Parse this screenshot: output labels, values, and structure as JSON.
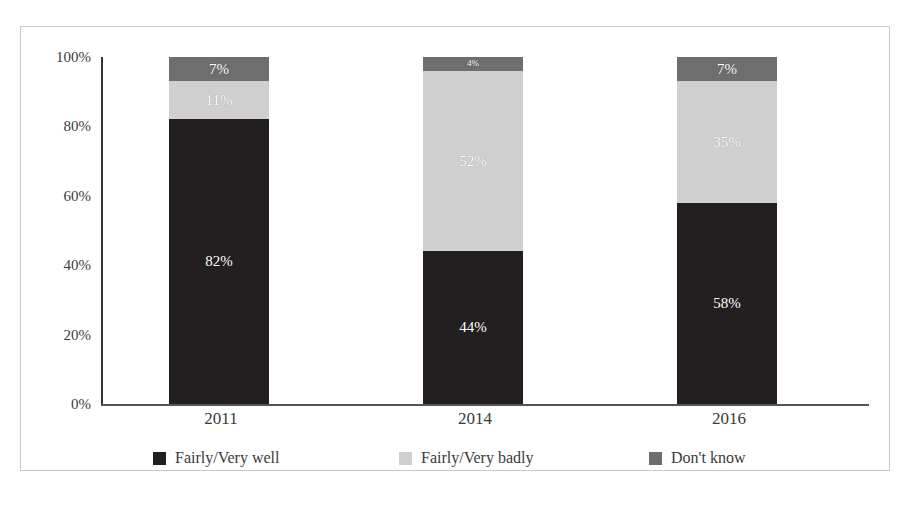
{
  "page": {
    "top_cropped_text": "",
    "caption": ""
  },
  "chart_data": {
    "type": "bar",
    "stacked": true,
    "stack_mode": "percent",
    "title": "",
    "subtitle": "",
    "xlabel": "",
    "ylabel": "",
    "categories": [
      "2011",
      "2014",
      "2016"
    ],
    "ylim": [
      0,
      100
    ],
    "yticks": [
      "0%",
      "20%",
      "40%",
      "60%",
      "80%",
      "100%"
    ],
    "ytick_values": [
      0,
      20,
      40,
      60,
      80,
      100
    ],
    "grid": false,
    "legend_position": "bottom",
    "series": [
      {
        "name": "Fairly/Very well",
        "color": "#231f20",
        "values": [
          82,
          44,
          58
        ],
        "labels": [
          "82%",
          "44%",
          "58%"
        ]
      },
      {
        "name": "Fairly/Very badly",
        "color": "#cfcfcf",
        "values": [
          11,
          52,
          35
        ],
        "labels": [
          "11%",
          "52%",
          "35%"
        ]
      },
      {
        "name": "Don't know",
        "color": "#6e6e6e",
        "values": [
          7,
          4,
          7
        ],
        "labels": [
          "7%",
          "4%",
          "7%"
        ]
      }
    ]
  },
  "colors": {
    "well": "#231f20",
    "badly": "#cfcfcf",
    "dontknow": "#6e6e6e",
    "axis": "#3a3a3a",
    "border": "#c9c9c9"
  }
}
